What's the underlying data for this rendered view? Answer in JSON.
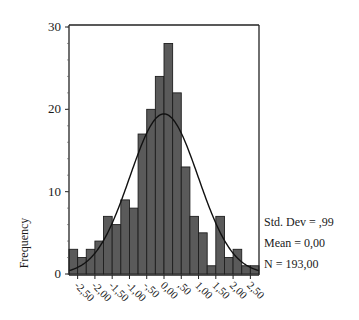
{
  "chart_data": {
    "type": "bar",
    "subtype": "histogram",
    "title": "",
    "xlabel": "",
    "ylabel": "Frequency",
    "bin_width": 0.25,
    "bin_start": -2.75,
    "categories": [
      "-2.625",
      "-2.375",
      "-2.125",
      "-1.875",
      "-1.625",
      "-1.375",
      "-1.125",
      "-0.875",
      "-0.625",
      "-0.375",
      "-0.125",
      "0.125",
      "0.375",
      "0.625",
      "0.875",
      "1.125",
      "1.375",
      "1.625",
      "1.875",
      "2.125",
      "2.375",
      "2.625"
    ],
    "values": [
      3,
      2,
      3,
      4,
      7,
      6,
      9,
      8,
      17,
      20,
      24,
      28,
      22,
      13,
      7,
      5,
      1,
      7,
      2,
      3,
      1,
      1
    ],
    "x_tick_labels": [
      "-2,50",
      "-2,00",
      "-1,50",
      "-1,00",
      "-,50",
      "0,00",
      ",50",
      "1,00",
      "1,50",
      "2,00",
      "2,50"
    ],
    "x_tick_values": [
      -2.5,
      -2.0,
      -1.5,
      -1.0,
      -0.5,
      0.0,
      0.5,
      1.0,
      1.5,
      2.0,
      2.5
    ],
    "y_tick_labels": [
      "0",
      "10",
      "20",
      "30"
    ],
    "y_tick_values": [
      0,
      10,
      20,
      30
    ],
    "ylim": [
      0,
      30
    ],
    "xlim": [
      -2.75,
      2.75
    ],
    "grid": false,
    "overlay": {
      "type": "normal-curve",
      "mean": 0.0,
      "std": 0.99,
      "n": 193
    },
    "stats": {
      "std_dev": "Std. Dev = ,99",
      "mean": "Mean = 0,00",
      "n": "N = 193,00"
    },
    "colors": {
      "bar_fill": "#5a5a5a",
      "bar_stroke": "#1e1e1e",
      "curve": "#111111",
      "axis": "#222222"
    }
  }
}
